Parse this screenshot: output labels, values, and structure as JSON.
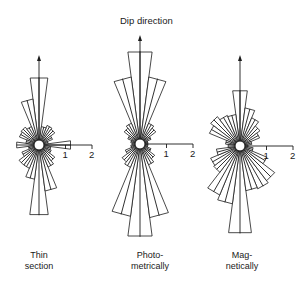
{
  "title": "Dip direction",
  "scale": {
    "unit_px": 26.5,
    "ticks": [
      "1",
      "2"
    ]
  },
  "roses": [
    {
      "label_line1": "Thin",
      "label_line2": "section",
      "center": [
        39,
        145
      ],
      "arrow_tip_y": 55,
      "petals": [
        {
          "az": 0,
          "len": 2.55
        },
        {
          "az": 345,
          "len": 1.75
        },
        {
          "az": 330,
          "len": 0.75
        },
        {
          "az": 315,
          "len": 0.85
        },
        {
          "az": 300,
          "len": 0.8
        },
        {
          "az": 285,
          "len": 0.5
        },
        {
          "az": 270,
          "len": 0.85
        },
        {
          "az": 15,
          "len": 0.7
        },
        {
          "az": 30,
          "len": 0.8
        },
        {
          "az": 45,
          "len": 0.75
        },
        {
          "az": 60,
          "len": 0.55
        },
        {
          "az": 75,
          "len": 0.35
        },
        {
          "az": 90,
          "len": 1.2
        },
        {
          "az": 105,
          "len": 0.45
        },
        {
          "az": 120,
          "len": 0.5
        },
        {
          "az": 135,
          "len": 0.75
        },
        {
          "az": 150,
          "len": 0.9
        },
        {
          "az": 165,
          "len": 1.75
        },
        {
          "az": 180,
          "len": 2.65
        },
        {
          "az": 195,
          "len": 1.3
        },
        {
          "az": 210,
          "len": 0.95
        },
        {
          "az": 225,
          "len": 0.95
        },
        {
          "az": 240,
          "len": 0.7
        },
        {
          "az": 255,
          "len": 0.4
        }
      ]
    },
    {
      "label_line1": "Photo-",
      "label_line2": "metrically",
      "center": [
        140,
        144
      ],
      "arrow_tip_y": 35,
      "petals": [
        {
          "az": 0,
          "len": 3.5
        },
        {
          "az": 345,
          "len": 2.55
        },
        {
          "az": 15,
          "len": 2.55
        },
        {
          "az": 330,
          "len": 0.85
        },
        {
          "az": 315,
          "len": 0.75
        },
        {
          "az": 300,
          "len": 0.5
        },
        {
          "az": 285,
          "len": 0.35
        },
        {
          "az": 30,
          "len": 0.85
        },
        {
          "az": 45,
          "len": 0.75
        },
        {
          "az": 60,
          "len": 0.45
        },
        {
          "az": 75,
          "len": 0.3
        },
        {
          "az": 90,
          "len": 0.3
        },
        {
          "az": 270,
          "len": 0.3
        },
        {
          "az": 105,
          "len": 0.3
        },
        {
          "az": 120,
          "len": 0.45
        },
        {
          "az": 135,
          "len": 0.7
        },
        {
          "az": 150,
          "len": 0.85
        },
        {
          "az": 165,
          "len": 2.8
        },
        {
          "az": 180,
          "len": 3.5
        },
        {
          "az": 195,
          "len": 2.75
        },
        {
          "az": 210,
          "len": 0.95
        },
        {
          "az": 225,
          "len": 0.85
        },
        {
          "az": 240,
          "len": 0.6
        },
        {
          "az": 255,
          "len": 0.35
        }
      ]
    },
    {
      "label_line1": "Mag-",
      "label_line2": "netically",
      "center": [
        240,
        146
      ],
      "arrow_tip_y": 55,
      "petals": [
        {
          "az": 0,
          "len": 2.1
        },
        {
          "az": 345,
          "len": 1.2
        },
        {
          "az": 330,
          "len": 1.25
        },
        {
          "az": 315,
          "len": 1.4
        },
        {
          "az": 300,
          "len": 1.25
        },
        {
          "az": 285,
          "len": 0.55
        },
        {
          "az": 270,
          "len": 0.45
        },
        {
          "az": 15,
          "len": 1.45
        },
        {
          "az": 30,
          "len": 1.15
        },
        {
          "az": 45,
          "len": 0.95
        },
        {
          "az": 60,
          "len": 0.8
        },
        {
          "az": 75,
          "len": 0.45
        },
        {
          "az": 90,
          "len": 0.3
        },
        {
          "az": 105,
          "len": 0.5
        },
        {
          "az": 120,
          "len": 1.1
        },
        {
          "az": 135,
          "len": 1.65
        },
        {
          "az": 150,
          "len": 1.75
        },
        {
          "az": 165,
          "len": 1.7
        },
        {
          "az": 180,
          "len": 3.3
        },
        {
          "az": 195,
          "len": 2.2
        },
        {
          "az": 210,
          "len": 2.0
        },
        {
          "az": 225,
          "len": 1.25
        },
        {
          "az": 240,
          "len": 1.2
        },
        {
          "az": 255,
          "len": 0.9
        }
      ]
    }
  ]
}
